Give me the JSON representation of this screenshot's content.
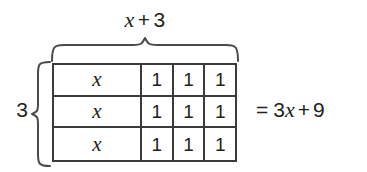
{
  "figure": {
    "type": "algebra-tile-area-model",
    "top_label": {
      "variable": "x",
      "operator": "+",
      "constant": "3",
      "full_text": "x + 3"
    },
    "left_label": {
      "multiplier": "3"
    },
    "grid": {
      "rows": 3,
      "columns_per_row": 4,
      "row_contents": [
        [
          "x",
          "1",
          "1",
          "1"
        ],
        [
          "x",
          "1",
          "1",
          "1"
        ],
        [
          "x",
          "1",
          "1",
          "1"
        ]
      ]
    },
    "equation": {
      "equals": "=",
      "coefficient": "3",
      "variable": "x",
      "operator": "+",
      "constant": "9",
      "full_text": "= 3x + 9"
    },
    "colors": {
      "ink": "#231f20",
      "line": "#3b3b3b",
      "background": "#ffffff"
    }
  }
}
